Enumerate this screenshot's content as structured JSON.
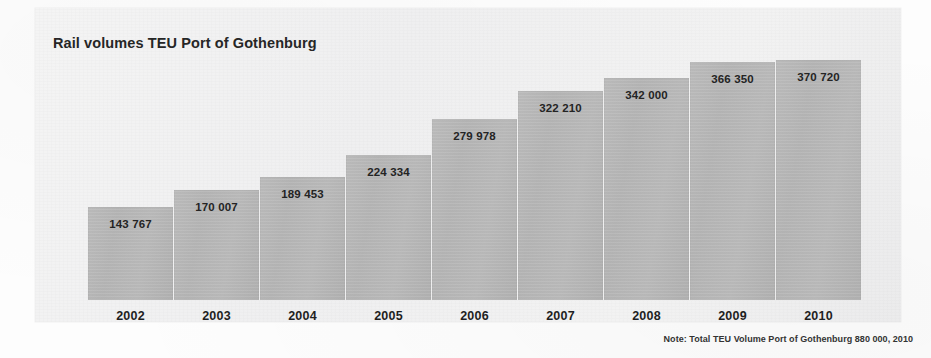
{
  "chart": {
    "title": "Rail volumes TEU Port of Gothenburg",
    "note": "Note: Total TEU Volume Port of Gothenburg 880 000, 2010",
    "bar_color": "#b8b8b8",
    "panel_color": "#f0f0f0",
    "text_color": "#1f1f1f"
  },
  "chart_data": {
    "type": "bar",
    "title": "Rail volumes TEU Port of Gothenburg",
    "subtitle": "",
    "xlabel": "",
    "ylabel": "",
    "grid": false,
    "legend": "none",
    "ylim": [
      0,
      370720
    ],
    "categories": [
      "2002",
      "2003",
      "2004",
      "2005",
      "2006",
      "2007",
      "2008",
      "2009",
      "2010"
    ],
    "values": [
      143767,
      170007,
      189453,
      224334,
      279978,
      322210,
      342000,
      366350,
      370720
    ],
    "value_labels": [
      "143 767",
      "170 007",
      "189 453",
      "224 334",
      "279 978",
      "322 210",
      "342 000",
      "366 350",
      "370 720"
    ],
    "annotations": [
      "Note: Total TEU Volume Port of Gothenburg 880 000, 2010"
    ],
    "bars": [
      {
        "year": "2002",
        "value": 143767,
        "label": "143 767",
        "left": 53,
        "height": 93
      },
      {
        "year": "2003",
        "value": 170007,
        "label": "170 007",
        "left": 139,
        "height": 110
      },
      {
        "year": "2004",
        "value": 189453,
        "label": "189 453",
        "left": 225,
        "height": 123
      },
      {
        "year": "2005",
        "value": 224334,
        "label": "224 334",
        "left": 311,
        "height": 145
      },
      {
        "year": "2006",
        "value": 279978,
        "label": "279 978",
        "left": 397,
        "height": 181
      },
      {
        "year": "2007",
        "value": 322210,
        "label": "322 210",
        "left": 483,
        "height": 209
      },
      {
        "year": "2008",
        "value": 342000,
        "label": "342 000",
        "left": 569,
        "height": 222
      },
      {
        "year": "2009",
        "value": 366350,
        "label": "366 350",
        "left": 655,
        "height": 238
      },
      {
        "year": "2010",
        "value": 370720,
        "label": "370 720",
        "left": 741,
        "height": 240
      }
    ]
  }
}
